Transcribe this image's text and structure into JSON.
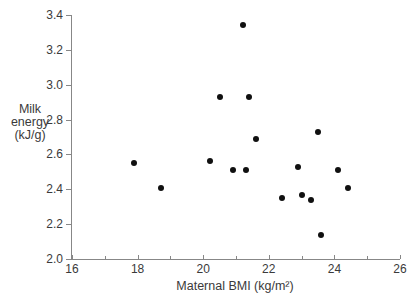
{
  "figure": {
    "background": "#ffffff",
    "text_color": "#3a3a3a",
    "axis_color": "#878787",
    "point_color": "#101010"
  },
  "chart_data": {
    "type": "scatter",
    "title": "",
    "xlabel": "Maternal BMI (kg/m²)",
    "ylabel": "Milk energy (kJ/g)",
    "ylabel_lines": [
      "Milk",
      "energy",
      "(kJ/g)"
    ],
    "xlim": [
      16,
      26
    ],
    "ylim": [
      2.0,
      3.4
    ],
    "x_major_ticks": [
      16,
      18,
      20,
      22,
      24,
      26
    ],
    "x_minor_ticks": [
      17,
      19,
      21,
      23,
      25
    ],
    "y_ticks": [
      2.0,
      2.2,
      2.4,
      2.6,
      2.8,
      3.0,
      3.2,
      3.4
    ],
    "grid": false,
    "legend_position": "none",
    "marker": "filled-circle",
    "points": [
      [
        17.9,
        2.55
      ],
      [
        18.7,
        2.41
      ],
      [
        20.2,
        2.56
      ],
      [
        20.5,
        2.93
      ],
      [
        20.9,
        2.51
      ],
      [
        21.2,
        3.34
      ],
      [
        21.3,
        2.51
      ],
      [
        21.4,
        2.93
      ],
      [
        21.6,
        2.69
      ],
      [
        22.4,
        2.35
      ],
      [
        22.9,
        2.53
      ],
      [
        23.0,
        2.37
      ],
      [
        23.3,
        2.34
      ],
      [
        23.5,
        2.73
      ],
      [
        23.6,
        2.14
      ],
      [
        24.1,
        2.51
      ],
      [
        24.4,
        2.41
      ]
    ]
  }
}
